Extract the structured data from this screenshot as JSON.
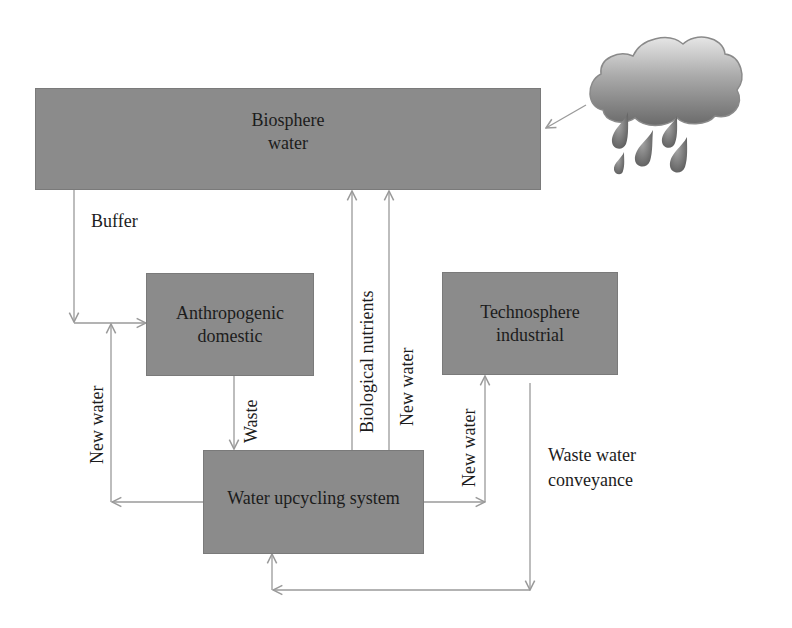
{
  "diagram": {
    "nodes": {
      "biosphere": {
        "line1": "Biosphere",
        "line2": "water"
      },
      "anthropogenic": {
        "line1": "Anthropogenic",
        "line2": "domestic"
      },
      "technosphere": {
        "line1": "Technosphere",
        "line2": "industrial"
      },
      "upcycling": {
        "line1": "Water upcycling system"
      }
    },
    "edges": {
      "buffer": "Buffer",
      "waste": "Waste",
      "new_water_left": "New water",
      "biological_nutrients": "Biological nutrients",
      "new_water_center": "New water",
      "new_water_right": "New water",
      "waste_water_line1": "Waste water",
      "waste_water_line2": "conveyance"
    },
    "icons": {
      "rain_cloud": "rain-cloud-icon"
    },
    "colors": {
      "box_fill": "#8b8b8b",
      "arrow": "#9a9a9a",
      "text": "#1c1c1c",
      "background": "#ffffff"
    }
  }
}
